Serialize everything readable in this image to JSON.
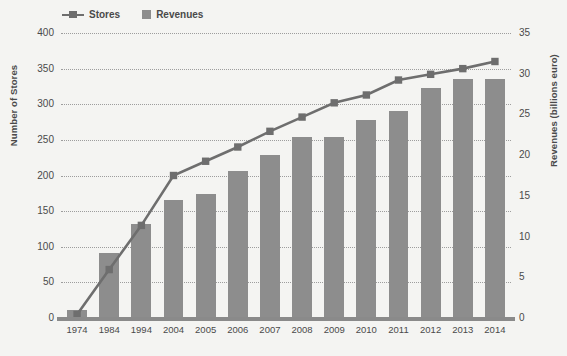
{
  "chart_data": {
    "type": "bar",
    "title": "",
    "xlabel": "",
    "ylabel": "Number of Stores",
    "y2label": "Revenues (billions euro)",
    "categories": [
      "1974",
      "1984",
      "1994",
      "2004",
      "2005",
      "2006",
      "2007",
      "2008",
      "2009",
      "2010",
      "2011",
      "2012",
      "2013",
      "2014"
    ],
    "ylim": [
      0,
      400
    ],
    "y2lim": [
      0,
      35
    ],
    "yticks": [
      "400",
      "350",
      "300",
      "250",
      "200",
      "150",
      "100",
      "50",
      "0"
    ],
    "y2ticks": [
      "35",
      "30",
      "25",
      "20",
      "15",
      "10",
      "5",
      "0"
    ],
    "grid": true,
    "legend_position": "top-left",
    "series": [
      {
        "name": "Stores",
        "type": "line",
        "axis": "left",
        "color": "#6e6e6e",
        "values": [
          5,
          68,
          130,
          200,
          220,
          240,
          262,
          282,
          302,
          313,
          334,
          342,
          350,
          360
        ]
      },
      {
        "name": "Revenues",
        "type": "bar",
        "axis": "right",
        "color": "#8d8d8d",
        "values": [
          1.0,
          8.0,
          11.5,
          14.5,
          15.2,
          18.0,
          20.0,
          22.2,
          22.2,
          24.3,
          25.4,
          28.2,
          29.4,
          29.4
        ]
      }
    ]
  },
  "legend": {
    "items": [
      {
        "label": "Stores"
      },
      {
        "label": "Revenues"
      }
    ]
  },
  "colors": {
    "background": "#f4f4f2",
    "bar": "#8d8d8d",
    "line": "#6e6e6e",
    "grid": "#9d9d9d",
    "text": "#4a4a4a"
  }
}
